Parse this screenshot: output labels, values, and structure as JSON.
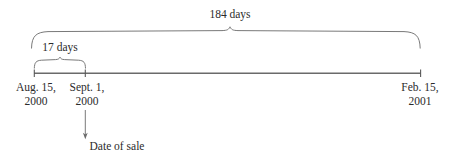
{
  "diagram": {
    "type": "timeline",
    "title": "",
    "background_color": "#ffffff",
    "line_color": "#666666",
    "text_color": "#2b2b2b",
    "axis": {
      "start_label": "Aug. 15,\n2000",
      "end_label": "Feb. 15,\n2001"
    },
    "spans": [
      {
        "id": "span-17-days",
        "label": "17 days",
        "from": "Aug. 15, 2000",
        "to": "Sept. 1, 2000",
        "days": 17
      },
      {
        "id": "span-184-days",
        "label": "184 days",
        "from": "Aug. 15, 2000",
        "to": "Feb. 15, 2001",
        "days": 184
      }
    ],
    "ticks": [
      {
        "id": "tick-aug-15",
        "line1": "Aug. 15,",
        "line2": "2000"
      },
      {
        "id": "tick-sept-1",
        "line1": "Sept. 1,",
        "line2": "2000"
      },
      {
        "id": "tick-feb-15",
        "line1": "Feb. 15,",
        "line2": "2001"
      }
    ],
    "annotation": {
      "id": "date-of-sale",
      "label": "Date of sale",
      "points_to": "Sept. 1, 2000"
    }
  }
}
